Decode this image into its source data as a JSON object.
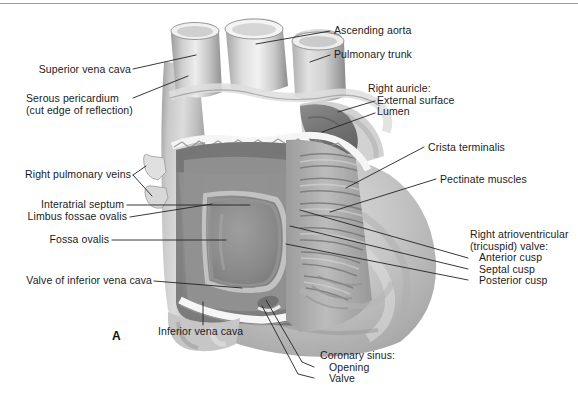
{
  "figure": {
    "panel_letter": "A",
    "top_rule_color": "#9a9aa0",
    "leader_color": "#232323",
    "text_color": "#1b1b1b",
    "background": "#ffffff"
  },
  "labels": {
    "superior_vena_cava": "Superior vena cava",
    "serous_pericardium_line1": "Serous pericardium",
    "serous_pericardium_line2": "(cut edge of reflection)",
    "right_pulmonary_veins": "Right pulmonary veins",
    "interatrial_septum": "Interatrial septum",
    "limbus_fossae_ovalis": "Limbus fossae ovalis",
    "fossa_ovalis": "Fossa ovalis",
    "valve_of_inferior_vena_cava": "Valve of inferior vena cava",
    "inferior_vena_cava": "Inferior vena cava",
    "ascending_aorta": "Ascending aorta",
    "pulmonary_trunk": "Pulmonary trunk",
    "right_auricle_header": "Right auricle:",
    "right_auricle_external_surface": "External surface",
    "right_auricle_lumen": "Lumen",
    "crista_terminalis": "Crista terminalis",
    "pectinate_muscles": "Pectinate muscles",
    "tricuspid_header_line1": "Right atrioventricular",
    "tricuspid_header_line2": "(tricuspid) valve:",
    "tricuspid_anterior_cusp": "Anterior cusp",
    "tricuspid_septal_cusp": "Septal cusp",
    "tricuspid_posterior_cusp": "Posterior cusp",
    "coronary_sinus_header": "Coronary sinus:",
    "coronary_sinus_opening": "Opening",
    "coronary_sinus_valve": "Valve"
  },
  "anatomy_tones": {
    "vessel_light": "#e9e9e9",
    "vessel_mid": "#c4c4c4",
    "vessel_shadow": "#8f8f8f",
    "atrium_wall": "#b9b9b9",
    "atrium_cavity": "#8d8d8d",
    "cavity_deep": "#6f6f6f",
    "pectinate_ridge": "#a5a5a5",
    "highlight_white": "#f7f7f7",
    "outline": "#6a6a6a"
  }
}
